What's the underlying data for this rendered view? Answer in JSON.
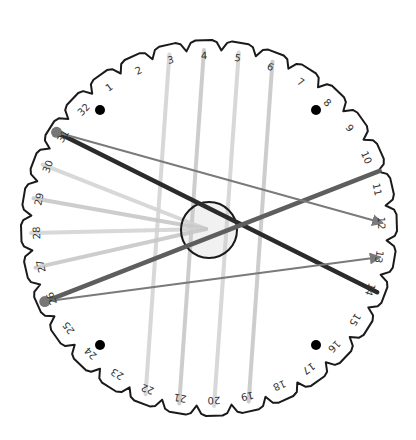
{
  "diagram": {
    "type": "kumihimo-disk",
    "slot_count": 32,
    "slot_labels": [
      "1",
      "2",
      "3",
      "4",
      "5",
      "6",
      "7",
      "8",
      "9",
      "10",
      "11",
      "12",
      "13",
      "14",
      "15",
      "16",
      "17",
      "18",
      "19",
      "20",
      "21",
      "22",
      "23",
      "24",
      "25",
      "26",
      "27",
      "28",
      "29",
      "30",
      "31",
      "32"
    ],
    "center": {
      "x": 209,
      "y": 228
    },
    "outer_radius": 186,
    "inner_circle_radius": 28,
    "colors": {
      "disk_outline": "#1a1a1a",
      "label": "#333333",
      "thread_light": "#d4d4d4",
      "thread_light_2": "#c8c8c8",
      "thread_dark": "#2b2b2b",
      "thread_medium": "#5e5e5e",
      "arrow": "#7a7a7a",
      "knob": "#777777",
      "dot": "#000000"
    },
    "light_threads": [
      {
        "from": "3",
        "to": "22"
      },
      {
        "from": "4",
        "to": "21"
      },
      {
        "from": "5",
        "to": "20"
      },
      {
        "from": "6",
        "to": "19"
      },
      {
        "from": "30",
        "to": "center"
      },
      {
        "from": "29",
        "to": "center"
      },
      {
        "from": "28",
        "to": "center"
      },
      {
        "from": "27",
        "to": "center"
      }
    ],
    "dark_threads": [
      {
        "from": "31",
        "to": "14",
        "shade": "dark"
      },
      {
        "from": "26",
        "to": "10/11",
        "shade": "medium"
      }
    ],
    "arrows": [
      {
        "from": "31",
        "to": "12"
      },
      {
        "from": "26",
        "to": "13"
      }
    ],
    "knobs": [
      {
        "slot": "31"
      },
      {
        "slot": "26"
      }
    ],
    "dots": [
      {
        "x": 100,
        "y": 110
      },
      {
        "x": 316,
        "y": 110
      },
      {
        "x": 100,
        "y": 345
      },
      {
        "x": 316,
        "y": 345
      }
    ]
  }
}
